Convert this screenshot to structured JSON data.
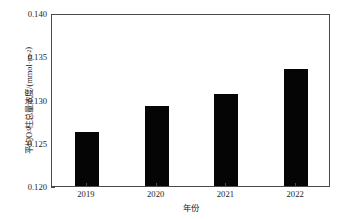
{
  "chart_data": {
    "type": "bar",
    "title": "",
    "xlabel": "年份",
    "ylabel_parts": {
      "pre": "平均O",
      "sub": "3",
      "mid": "柱总量浓度/(mmol·m",
      "sup": "-2",
      "post": ")"
    },
    "ylabel_plain": "平均O3柱总量浓度/(mmol·m-2)",
    "categories": [
      "2019",
      "2020",
      "2021",
      "2022"
    ],
    "values": [
      0.1262,
      0.1292,
      0.1306,
      0.1335
    ],
    "ylim": [
      0.12,
      0.14
    ],
    "yticks": [
      "0.120",
      "0.125",
      "0.130",
      "0.135",
      "0.140"
    ],
    "ytick_values": [
      0.12,
      0.125,
      0.13,
      0.135,
      0.14
    ],
    "grid": false,
    "legend": false,
    "bar_color": "#050505",
    "axis_color": "#4a4a4a",
    "bar_width_px": 24
  }
}
